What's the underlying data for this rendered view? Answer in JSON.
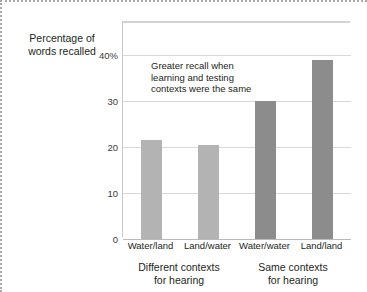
{
  "figure": {
    "photo_credit": "Fred McConnaughey/Photo Researchers"
  },
  "chart_data": {
    "type": "bar",
    "title": "",
    "xlabel": "",
    "ylabel": "Percentage of words recalled",
    "ylim": [
      0,
      47
    ],
    "yticks": [
      0,
      10,
      20,
      30,
      40
    ],
    "ytick_labels": [
      "0",
      "10",
      "20",
      "30",
      "40%"
    ],
    "grid": true,
    "legend": "none",
    "categories": [
      "Water/land",
      "Land/water",
      "Water/water",
      "Land/land"
    ],
    "values": [
      21.5,
      20.5,
      30,
      39
    ],
    "bar_colors": [
      "#b3b3b3",
      "#b3b3b3",
      "#8c8c8c",
      "#8c8c8c"
    ],
    "annotations": [
      {
        "text": "Greater recall when learning and testing contexts were the same"
      }
    ],
    "groups": [
      {
        "label_line1": "Different contexts",
        "label_line2": "for hearing",
        "categories": [
          "Water/land",
          "Land/water"
        ]
      },
      {
        "label_line1": "Same contexts",
        "label_line2": "for hearing",
        "categories": [
          "Water/water",
          "Land/land"
        ]
      }
    ]
  }
}
